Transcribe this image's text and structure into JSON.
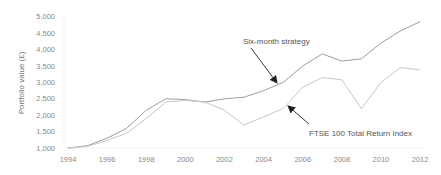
{
  "chart_data": {
    "type": "line",
    "title": "",
    "xlabel": "",
    "ylabel": "Portfolio value (£)",
    "ylim": [
      1000,
      5000
    ],
    "xlim": [
      1994,
      2012
    ],
    "grid": false,
    "legend": "none (inline annotations with arrows)",
    "y_ticks": [
      "1,000",
      "1,500",
      "2,000",
      "2,500",
      "3,000",
      "3,500",
      "4,000",
      "4,500",
      "5,000"
    ],
    "x_ticks": [
      "1994",
      "1996",
      "1998",
      "2000",
      "2002",
      "2004",
      "2006",
      "2008",
      "2010",
      "2012"
    ],
    "x": [
      1994,
      1995,
      1996,
      1997,
      1998,
      1999,
      2000,
      2001,
      2002,
      2003,
      2004,
      2005,
      2006,
      2007,
      2008,
      2009,
      2010,
      2011,
      2012
    ],
    "series": [
      {
        "name": "Six-month strategy",
        "color": "#9e9e9e",
        "values": [
          1000,
          1070,
          1300,
          1600,
          2150,
          2500,
          2480,
          2400,
          2500,
          2550,
          2750,
          3000,
          3500,
          3870,
          3650,
          3720,
          4200,
          4570,
          4850
        ]
      },
      {
        "name": "FTSE 100 Total Return Index",
        "color": "#c8c8c8",
        "values": [
          1000,
          1050,
          1230,
          1450,
          1900,
          2400,
          2450,
          2400,
          2150,
          1700,
          1950,
          2200,
          2850,
          3150,
          3080,
          2200,
          3000,
          3450,
          3380
        ]
      }
    ],
    "annotations": [
      {
        "text": "Six-month strategy",
        "points_to": "Six-month strategy line near 2005"
      },
      {
        "text": "FTSE 100 Total Return Index",
        "points_to": "FTSE 100 line near 2005"
      }
    ]
  }
}
